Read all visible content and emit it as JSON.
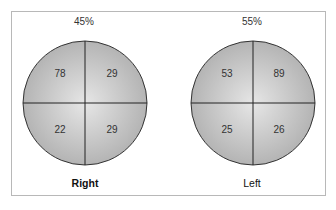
{
  "figure": {
    "panels": [
      {
        "percent": "45%",
        "label": "Right",
        "quadrants": {
          "top_left": "78",
          "top_right": "29",
          "bottom_left": "22",
          "bottom_right": "29"
        }
      },
      {
        "percent": "55%",
        "label": "Left",
        "quadrants": {
          "top_left": "53",
          "top_right": "89",
          "bottom_left": "25",
          "bottom_right": "26"
        }
      }
    ]
  },
  "colors": {
    "circle_fill_light": "#e6e6e6",
    "circle_fill_dark": "#b4b4b4",
    "stroke": "#333333",
    "frame": "#b8b8b8"
  }
}
